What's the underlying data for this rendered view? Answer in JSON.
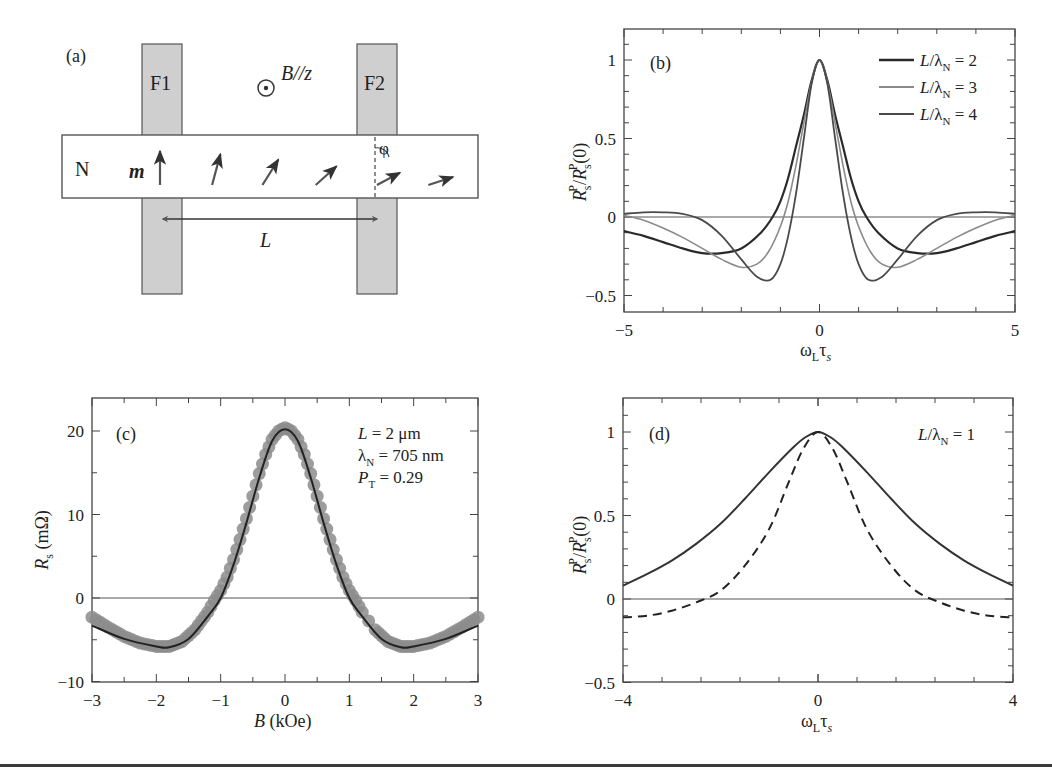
{
  "figure": {
    "panel_a": {
      "label": "(a)",
      "electrode_left": "F1",
      "electrode_right": "F2",
      "channel": "N",
      "field_label": "B//z",
      "magnetization_label": "m",
      "length_label": "L",
      "angle_label": "φ",
      "arrow_angles_deg": [
        0,
        15,
        32,
        48,
        62,
        72
      ]
    },
    "panel_b": {
      "label": "(b)",
      "ylabel_main": "R",
      "ylabel_full": "R_s^P / R_s^P(0)",
      "xlabel_main": "ω",
      "xlabel_full": "ω_L τ_s",
      "legend": [
        "L/λN = 2",
        "L/λN = 3",
        "L/λN = 4"
      ]
    },
    "panel_c": {
      "label": "(c)",
      "ylabel_full": "R_s (mΩ)",
      "xlabel_full": "B (kOe)",
      "annotations": [
        "L = 2 μm",
        "λN = 705 nm",
        "PT = 0.29"
      ]
    },
    "panel_d": {
      "label": "(d)",
      "ylabel_full": "R_s^P / R_s^P(0)",
      "xlabel_full": "ω_L τ_s",
      "annotation": "L/λN = 1"
    }
  },
  "chart_data": [
    {
      "panel": "b",
      "type": "line",
      "title": "",
      "xlabel": "ωLτs",
      "ylabel": "RsP/RsP(0)",
      "xlim": [
        -5,
        5
      ],
      "ylim": [
        -0.6,
        1.2
      ],
      "xticks": [
        -5,
        0,
        5
      ],
      "yticks": [
        -0.5,
        0,
        0.5,
        1
      ],
      "grid": false,
      "legend_position": "upper right",
      "series": [
        {
          "name": "L/λN = 2",
          "color": "#2a2a2a",
          "width": 2.2,
          "x": [
            -5,
            -4.5,
            -4,
            -3.5,
            -3,
            -2.5,
            -2,
            -1.5,
            -1.2,
            -1,
            -0.8,
            -0.6,
            -0.4,
            -0.2,
            0,
            0.2,
            0.4,
            0.6,
            0.8,
            1,
            1.2,
            1.5,
            2,
            2.5,
            3,
            3.5,
            4,
            4.5,
            5
          ],
          "y": [
            -0.09,
            -0.12,
            -0.16,
            -0.2,
            -0.23,
            -0.23,
            -0.2,
            -0.1,
            0.0,
            0.1,
            0.25,
            0.45,
            0.65,
            0.87,
            1.0,
            0.87,
            0.65,
            0.45,
            0.25,
            0.1,
            0.0,
            -0.1,
            -0.2,
            -0.23,
            -0.23,
            -0.2,
            -0.16,
            -0.12,
            -0.09
          ]
        },
        {
          "name": "L/λN = 3",
          "color": "#8a8a8a",
          "width": 1.6,
          "x": [
            -5,
            -4.5,
            -4,
            -3.5,
            -3,
            -2.5,
            -2,
            -1.6,
            -1.3,
            -1,
            -0.8,
            -0.6,
            -0.4,
            -0.2,
            0,
            0.2,
            0.4,
            0.6,
            0.8,
            1,
            1.3,
            1.6,
            2,
            2.5,
            3,
            3.5,
            4,
            4.5,
            5
          ],
          "y": [
            0.01,
            -0.02,
            -0.07,
            -0.13,
            -0.2,
            -0.27,
            -0.32,
            -0.3,
            -0.22,
            -0.06,
            0.1,
            0.33,
            0.6,
            0.86,
            1.0,
            0.86,
            0.6,
            0.33,
            0.1,
            -0.06,
            -0.22,
            -0.3,
            -0.32,
            -0.27,
            -0.2,
            -0.13,
            -0.07,
            -0.02,
            0.01
          ]
        },
        {
          "name": "L/λN = 4",
          "color": "#4a4a4a",
          "width": 1.8,
          "x": [
            -5,
            -4.5,
            -4,
            -3.5,
            -3,
            -2.5,
            -2,
            -1.6,
            -1.25,
            -1,
            -0.8,
            -0.6,
            -0.4,
            -0.2,
            0,
            0.2,
            0.4,
            0.6,
            0.8,
            1,
            1.25,
            1.6,
            2,
            2.5,
            3,
            3.5,
            4,
            4.5,
            5
          ],
          "y": [
            0.02,
            0.03,
            0.03,
            0.02,
            -0.02,
            -0.12,
            -0.27,
            -0.38,
            -0.4,
            -0.3,
            -0.12,
            0.15,
            0.5,
            0.85,
            1.0,
            0.85,
            0.5,
            0.15,
            -0.12,
            -0.3,
            -0.4,
            -0.38,
            -0.27,
            -0.12,
            -0.02,
            0.02,
            0.03,
            0.03,
            0.02
          ]
        }
      ]
    },
    {
      "panel": "c",
      "type": "scatter",
      "title": "",
      "xlabel": "B (kOe)",
      "ylabel": "Rs (mΩ)",
      "xlim": [
        -3,
        3
      ],
      "ylim": [
        -10,
        25
      ],
      "xticks": [
        -3,
        -2,
        -1,
        0,
        1,
        2,
        3
      ],
      "yticks": [
        -10,
        0,
        10,
        20
      ],
      "grid": false,
      "series": [
        {
          "name": "data",
          "kind": "markers",
          "color": "#8c8c8c",
          "x": [
            -3,
            -2.75,
            -2.5,
            -2.25,
            -2,
            -1.8,
            -1.6,
            -1.4,
            -1.2,
            -1.1,
            -1.0,
            -0.9,
            -0.8,
            -0.7,
            -0.6,
            -0.5,
            -0.4,
            -0.3,
            -0.2,
            -0.1,
            0,
            0.1,
            0.2,
            0.3,
            0.4,
            0.5,
            0.6,
            0.7,
            0.8,
            0.9,
            1.0,
            1.1,
            1.2,
            1.4,
            1.6,
            1.8,
            2,
            2.25,
            2.5,
            2.75,
            3
          ],
          "y": [
            -2.3,
            -3.5,
            -4.6,
            -5.4,
            -5.8,
            -5.8,
            -5.2,
            -3.8,
            -1.7,
            -0.3,
            0.9,
            2.5,
            4.6,
            7.0,
            9.5,
            12.2,
            14.9,
            17.2,
            19.0,
            20.0,
            20.4,
            20.0,
            19.0,
            17.2,
            14.9,
            12.2,
            9.5,
            7.0,
            4.6,
            2.5,
            0.9,
            -0.3,
            -1.7,
            -3.8,
            -5.2,
            -5.8,
            -5.8,
            -5.4,
            -4.6,
            -3.5,
            -2.3
          ]
        },
        {
          "name": "fit",
          "kind": "line",
          "color": "#222222",
          "x": [
            -3,
            -2.5,
            -2,
            -1.8,
            -1.5,
            -1.2,
            -1,
            -0.8,
            -0.6,
            -0.4,
            -0.2,
            0,
            0.2,
            0.4,
            0.6,
            0.8,
            1,
            1.2,
            1.5,
            1.8,
            2,
            2.5,
            3
          ],
          "y": [
            -3.3,
            -4.9,
            -5.8,
            -5.9,
            -4.9,
            -2.2,
            0.0,
            4.0,
            9.0,
            14.4,
            18.8,
            20.2,
            18.8,
            14.4,
            9.0,
            4.0,
            0.0,
            -2.2,
            -4.9,
            -5.9,
            -5.8,
            -4.9,
            -3.3
          ]
        }
      ],
      "annotations": [
        "L = 2 μm",
        "λN = 705 nm",
        "PT = 0.29"
      ]
    },
    {
      "panel": "d",
      "type": "line",
      "title": "",
      "xlabel": "ωLτs",
      "ylabel": "RsP/RsP(0)",
      "xlim": [
        -4,
        4
      ],
      "ylim": [
        -0.5,
        1.2
      ],
      "xticks": [
        -4,
        0,
        4
      ],
      "yticks": [
        -0.5,
        0,
        0.5,
        1
      ],
      "grid": false,
      "series": [
        {
          "name": "solid",
          "style": "solid",
          "color": "#333333",
          "x": [
            -4,
            -3.5,
            -3,
            -2.5,
            -2,
            -1.5,
            -1,
            -0.5,
            -0.25,
            0,
            0.25,
            0.5,
            1,
            1.5,
            2,
            2.5,
            3,
            3.5,
            4
          ],
          "y": [
            0.08,
            0.15,
            0.23,
            0.33,
            0.45,
            0.6,
            0.76,
            0.91,
            0.97,
            1.0,
            0.97,
            0.91,
            0.76,
            0.6,
            0.45,
            0.33,
            0.23,
            0.15,
            0.08
          ]
        },
        {
          "name": "dashed",
          "style": "dashed",
          "color": "#222222",
          "x": [
            -4,
            -3.5,
            -3,
            -2.5,
            -2,
            -1.5,
            -1,
            -0.6,
            -0.3,
            0,
            0.3,
            0.6,
            1,
            1.5,
            2,
            2.5,
            3,
            3.5,
            4
          ],
          "y": [
            -0.11,
            -0.1,
            -0.07,
            -0.02,
            0.05,
            0.2,
            0.42,
            0.7,
            0.9,
            1.0,
            0.9,
            0.7,
            0.42,
            0.2,
            0.05,
            -0.02,
            -0.07,
            -0.1,
            -0.11
          ]
        }
      ],
      "annotations": [
        "L/λN = 1"
      ]
    }
  ]
}
